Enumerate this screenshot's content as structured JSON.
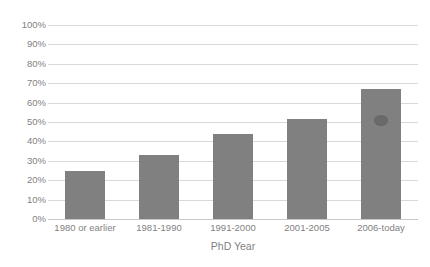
{
  "chart_data": {
    "type": "bar",
    "title": "",
    "subtitle": "",
    "xlabel": "PhD Year",
    "ylabel": "",
    "categories": [
      "1980 or earlier",
      "1981-1990",
      "1991-2000",
      "2001-2005",
      "2006-today"
    ],
    "values": [
      25,
      33,
      44,
      51.5,
      67
    ],
    "value_labels": [
      "25%",
      "33%",
      "44%",
      "51.5%",
      "67%"
    ],
    "ylim": [
      0,
      100
    ],
    "ytick_labels": [
      "100%",
      "90%",
      "80%",
      "70%",
      "60%",
      "50%",
      "40%",
      "30%",
      "20%",
      "10%",
      "0%"
    ],
    "ytick_values": [
      100,
      90,
      80,
      70,
      60,
      50,
      40,
      30,
      20,
      10,
      0
    ],
    "grid": true,
    "legend": false,
    "legend_position": "none",
    "series": [
      {
        "name": "",
        "values": [
          25,
          33,
          44,
          51.5,
          67
        ]
      }
    ],
    "annotations": [
      {
        "name": "smudge-artifact",
        "category": "2006-today",
        "at_value": 48
      }
    ]
  },
  "colors": {
    "bar": "#808080",
    "gridline": "#d9d9d9",
    "baseline": "#c8c8c8",
    "tick_label": "#7f7f7f",
    "background": "#ffffff"
  }
}
